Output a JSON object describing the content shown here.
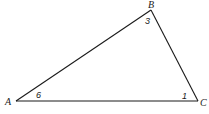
{
  "diagram": {
    "type": "triangle",
    "stroke_color": "#1a1a1a",
    "background": "#ffffff",
    "vertices": [
      {
        "id": "A",
        "label": "A",
        "x": 16,
        "y": 101,
        "label_x": 5,
        "label_y": 105
      },
      {
        "id": "B",
        "label": "B",
        "x": 151,
        "y": 10,
        "label_x": 148,
        "label_y": 8
      },
      {
        "id": "C",
        "label": "C",
        "x": 198,
        "y": 101,
        "label_x": 200,
        "label_y": 106
      }
    ],
    "edges": [
      {
        "from": "A",
        "to": "B"
      },
      {
        "from": "B",
        "to": "C"
      },
      {
        "from": "A",
        "to": "C"
      }
    ],
    "angle_labels": [
      {
        "vertex": "A",
        "label": "6",
        "x": 36,
        "y": 98
      },
      {
        "vertex": "B",
        "label": "3",
        "x": 145,
        "y": 24
      },
      {
        "vertex": "C",
        "label": "1",
        "x": 182,
        "y": 99
      }
    ]
  }
}
